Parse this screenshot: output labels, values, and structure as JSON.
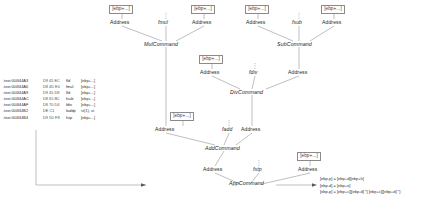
{
  "diagram": {
    "nodes": {
      "mem_mul_left": "[ebp+...]",
      "mem_mul_right": "[ebp+...]",
      "mem_sub_left": "[ebp+...]",
      "mem_sub_right": "[ebp+...]",
      "mem_div_left": "[ebp+...]",
      "mem_add_left": "[ebp+...]",
      "mem_app_right": "[ebp+...]",
      "addr_mul_left": "Address",
      "addr_mul_right": "Address",
      "addr_sub_left": "Address",
      "addr_sub_right": "Address",
      "addr_div_left": "Address",
      "addr_div_right": "Address",
      "addr_add_left": "Address",
      "addr_add_right": "Address",
      "addr_app_left": "Address",
      "addr_app_right": "Address",
      "op_fmul": "fmul",
      "op_fsub": "fsub",
      "op_fdiv": "fdiv",
      "op_fadd": "fadd",
      "op_fstp": "fstp",
      "cmd_mul": "MulCommand",
      "cmd_sub": "SubCommand",
      "cmd_div": "DivCommand",
      "cmd_add": "AddCommand",
      "cmd_app": "AppCommand"
    }
  },
  "listing": {
    "columns": [
      "address",
      "bytes",
      "mnemonic",
      "operands"
    ],
    "rows": [
      {
        "address": ".text:004f44A3",
        "bytes": "D9 45 EC",
        "mnemonic": "fld",
        "operands": "[ebp+...]"
      },
      {
        "address": ".text:004f44A6",
        "bytes": "D8 4D E0",
        "mnemonic": "fmul",
        "operands": "[ebp+...]"
      },
      {
        "address": ".text:004f44A9",
        "bytes": "D9 45 D8",
        "mnemonic": "fld",
        "operands": "[ebp+...]"
      },
      {
        "address": ".text:004f44AC",
        "bytes": "D8 65 BC",
        "mnemonic": "fsub",
        "operands": "[ebp+...]"
      },
      {
        "address": ".text:004f44AF",
        "bytes": "D8 70 D4",
        "mnemonic": "fdiv",
        "operands": "[ebp+...]"
      },
      {
        "address": ".text:004f44B2",
        "bytes": "DE C1",
        "mnemonic": "faddp",
        "operands": "st(1), st"
      },
      {
        "address": ".text:004f44B4",
        "bytes": "D9 5D F8",
        "mnemonic": "fstp",
        "operands": "[ebp+...]"
      }
    ]
  },
  "expressions": {
    "lines": [
      "[ebp-p] = [ebp+d][ebp+h]",
      "[ebp-d] = [ebp+e]",
      "[ebp-p] = [ebp+c][[ebp-d]  *] [ebp+c][[ebp+d]  *]"
    ]
  }
}
